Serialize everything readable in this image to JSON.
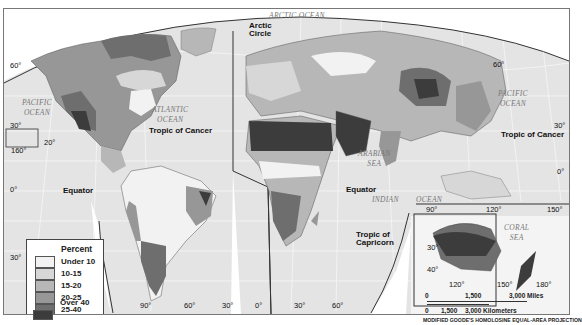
{
  "map": {
    "projection_label": "MODIFIED GOODE'S HOMOLOSINE EQUAL-AREA PROJECTION",
    "colors": {
      "under_10": "#f2f2f2",
      "10_15": "#d7d7d7",
      "15_20": "#b7b7b7",
      "20_25": "#979797",
      "25_40": "#6e6e6e",
      "over_40": "#3c3c3c",
      "ocean": "#e4e4e4",
      "border": "#444444"
    }
  },
  "legend": {
    "title": "Percent",
    "items": [
      {
        "label": "Under 10",
        "color": "#f2f2f2"
      },
      {
        "label": "10-15",
        "color": "#d7d7d7"
      },
      {
        "label": "15-20",
        "color": "#b7b7b7"
      },
      {
        "label": "20-25",
        "color": "#979797"
      },
      {
        "label": "25-40",
        "color": "#6e6e6e"
      },
      {
        "label": "Over 40",
        "color": "#3c3c3c"
      }
    ]
  },
  "labels": {
    "lines": {
      "arctic_circle_1": "Arctic",
      "arctic_circle_2": "Circle",
      "tropic_cancer_west": "Tropic of Cancer",
      "tropic_cancer_east": "Tropic of Cancer",
      "equator_west": "Equator",
      "equator_east": "Equator",
      "tropic_capricorn_1": "Tropic of",
      "tropic_capricorn_2": "Capricorn"
    },
    "oceans": {
      "arctic": "ARCTIC OCEAN",
      "pacific_west_1": "PACIFIC",
      "pacific_west_2": "OCEAN",
      "atlantic_1": "ATLANTIC",
      "atlantic_2": "OCEAN",
      "pacific_east_1": "PACIFIC",
      "pacific_east_2": "OCEAN",
      "arabian_1": "ARABIAN",
      "arabian_2": "SEA",
      "indian": "INDIAN",
      "indian_ocean": "OCEAN",
      "coral_1": "CORAL",
      "coral_2": "SEA"
    },
    "degrees": {
      "lat_60_w": "60°",
      "lat_30_w": "30°",
      "lat_20_hawaii": "20°",
      "lon_160_hawaii": "160°",
      "lat_0_w": "0°",
      "lat_30s_w": "30°",
      "lon_90_sa": "90°",
      "lon_60_sa": "60°",
      "lon_30_sa": "30°",
      "lon_0_af": "0°",
      "lon_30_af": "30°",
      "lon_60_af": "60°",
      "lat_60_e": "60°",
      "lat_30_e": "30°",
      "lat_0_e": "0°",
      "lon_90_e": "90°",
      "lon_120_e": "120°",
      "lon_150_e": "150°",
      "lat_30_au": "30°",
      "lat_40_au": "40°",
      "lon_120_au": "120°",
      "lon_150_au": "150°",
      "lon_180_au": "180°"
    }
  },
  "scale": {
    "miles_ticks": [
      "0",
      "1,500",
      "3,000 Miles"
    ],
    "km_ticks": [
      "0",
      "1,500",
      "3,000 Kilometers"
    ]
  }
}
